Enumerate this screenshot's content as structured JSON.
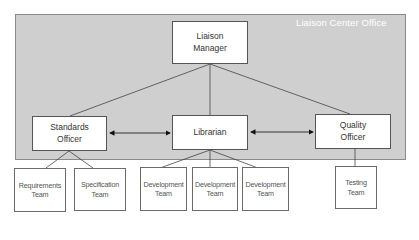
{
  "container": {
    "label": "Liaison Center Office",
    "fill": "#cfcfcf"
  },
  "nodes": {
    "manager": {
      "label": "Liaison\nManager"
    },
    "standards": {
      "label": "Standards\nOfficer"
    },
    "librarian": {
      "label": "Librarian"
    },
    "quality": {
      "label": "Quality\nOfficer"
    }
  },
  "teams": [
    {
      "label": "Requirements\nTeam",
      "parent": "Standards Officer"
    },
    {
      "label": "Specification\nTeam",
      "parent": "Standards Officer"
    },
    {
      "label": "Development\nTeam",
      "parent": "Librarian"
    },
    {
      "label": "Development\nTeam",
      "parent": "Librarian"
    },
    {
      "label": "Development\nTeam",
      "parent": "Librarian"
    },
    {
      "label": "Testing\nTeam",
      "parent": "Quality Officer"
    }
  ],
  "connections": [
    {
      "from": "Liaison Manager",
      "to": "Standards Officer",
      "type": "line"
    },
    {
      "from": "Liaison Manager",
      "to": "Librarian",
      "type": "line"
    },
    {
      "from": "Liaison Manager",
      "to": "Quality Officer",
      "type": "line"
    },
    {
      "from": "Standards Officer",
      "to": "Librarian",
      "type": "bidirectional-arrow"
    },
    {
      "from": "Librarian",
      "to": "Quality Officer",
      "type": "bidirectional-arrow"
    }
  ]
}
